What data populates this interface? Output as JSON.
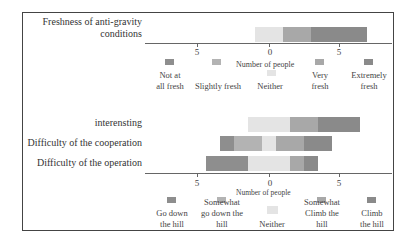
{
  "colors": {
    "neg_strong": "#8e8e8e",
    "neg_mild": "#b3b3b3",
    "neutral": "#e4e4e4",
    "pos_mild": "#a8a8a8",
    "pos_strong": "#8a8a8a"
  },
  "chart_data": [
    {
      "type": "bar",
      "orientation": "horizontal-diverging-stacked",
      "title": "",
      "categories": [
        "Freshness of anti-gravity conditions"
      ],
      "xlabel": "Number of people",
      "ylabel": "",
      "xticks": [
        "5",
        "0",
        "5"
      ],
      "xlim": [
        -7.5,
        8.5
      ],
      "legend": [
        "Not at all fresh",
        "Slightly fresh",
        "Neither",
        "Very fresh",
        "Extremely fresh"
      ],
      "legend_position": "bottom",
      "series": [
        {
          "name": "Not at all fresh",
          "values": [
            0
          ]
        },
        {
          "name": "Slightly fresh",
          "values": [
            0
          ]
        },
        {
          "name": "Neither",
          "values": [
            2
          ]
        },
        {
          "name": "Very fresh",
          "values": [
            2
          ]
        },
        {
          "name": "Extremely fresh",
          "values": [
            4
          ]
        }
      ]
    },
    {
      "type": "bar",
      "orientation": "horizontal-diverging-stacked",
      "title": "",
      "categories": [
        "interensting",
        "Difficulty of the cooperation",
        "Difficulty of the operation"
      ],
      "xlabel": "Number of people",
      "ylabel": "",
      "xticks": [
        "5",
        "0",
        "5"
      ],
      "xlim": [
        -7.5,
        8.5
      ],
      "legend": [
        "Go down the hill",
        "Somewhat go down the hill",
        "Neither",
        "Somewhat Climb the hill",
        "Climb the hill"
      ],
      "legend_position": "bottom",
      "series": [
        {
          "name": "Go down the hill",
          "values": [
            0,
            1,
            3
          ]
        },
        {
          "name": "Somewhat go down the hill",
          "values": [
            0,
            2,
            0
          ]
        },
        {
          "name": "Neither",
          "values": [
            3,
            1,
            3
          ]
        },
        {
          "name": "Somewhat Climb the hill",
          "values": [
            2,
            2,
            1
          ]
        },
        {
          "name": "Climb the hill",
          "values": [
            3,
            2,
            1
          ]
        }
      ]
    }
  ],
  "chart1": {
    "row_label_line1": "Freshness of anti-gravity",
    "row_label_line2": "conditions",
    "ticks": [
      "5",
      "0",
      "5"
    ],
    "axis_title": "Number of people",
    "legend": [
      {
        "line1": "Not at",
        "line2": "all fresh"
      },
      {
        "line1": "Slightly fresh",
        "line2": ""
      },
      {
        "line1": "Neither",
        "line2": ""
      },
      {
        "line1": "Very",
        "line2": "fresh"
      },
      {
        "line1": "Extremely",
        "line2": "fresh"
      }
    ]
  },
  "chart2": {
    "row_labels": [
      "interensting",
      "Difficulty of the cooperation",
      "Difficulty of the operation"
    ],
    "ticks": [
      "5",
      "0",
      "5"
    ],
    "axis_title": "Number of people",
    "legend": [
      {
        "line1": "Go down",
        "line2": "the hill"
      },
      {
        "line1": "Somewhat",
        "line2": "go down the",
        "line3": "hill"
      },
      {
        "line1": "Neither"
      },
      {
        "line1": "Somewhat",
        "line2": "Climb the",
        "line3": "hill"
      },
      {
        "line1": "Climb",
        "line2": "the hill"
      }
    ]
  }
}
